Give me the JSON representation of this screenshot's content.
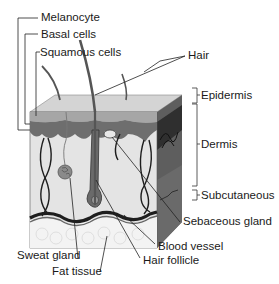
{
  "diagram": {
    "labels": {
      "melanocyte": "Melanocyte",
      "basal_cells": "Basal cells",
      "squamous_cells": "Squamous cells",
      "hair": "Hair",
      "epidermis": "Epidermis",
      "dermis": "Dermis",
      "subcutaneous": "Subcutaneous",
      "sebaceous_gland": "Sebaceous gland",
      "blood_vessel": "Blood vessel",
      "hair_follicle": "Hair follicle",
      "sweat_gland": "Sweat gland",
      "fat_tissue": "Fat tissue"
    },
    "colors": {
      "epidermis_top": "#cfcfcf",
      "epidermis_layer": "#9a9a9a",
      "basal_layer": "#6e6e6e",
      "dermis": "#e2e2e2",
      "side_face": "#5a5a5a",
      "side_dark": "#2e2e2e",
      "fat": "#f2f2f2",
      "vessel": "#222222",
      "line": "#333333"
    }
  }
}
